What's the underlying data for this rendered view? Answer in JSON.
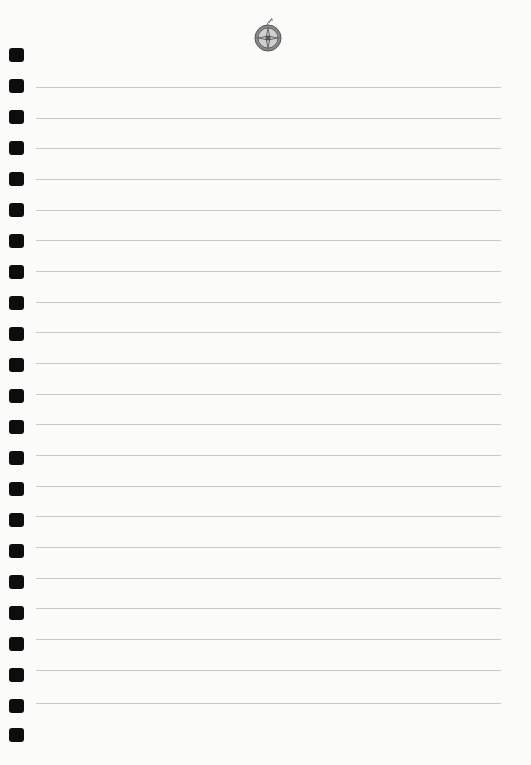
{
  "page": {
    "type": "ruled notebook page",
    "background": "#fbfbfa",
    "rule_color": "#c9c9c9",
    "hole_color": "#0d0d0d",
    "emblem": "compass-rose-emblem-icon",
    "binding_holes": [
      55,
      86,
      117,
      148,
      179,
      210,
      241,
      272,
      303,
      334,
      365,
      396,
      427,
      458,
      489,
      520,
      551,
      582,
      613,
      644,
      675,
      706,
      735
    ],
    "rule_lines": [
      87,
      118,
      148,
      179,
      210,
      240,
      271,
      302,
      332,
      363,
      394,
      424,
      455,
      486,
      516,
      547,
      578,
      608,
      639,
      670,
      703
    ]
  }
}
